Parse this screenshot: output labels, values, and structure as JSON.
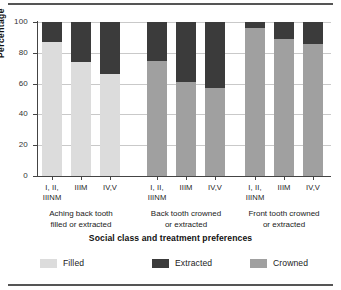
{
  "figure": {
    "rule_color": "#555555"
  },
  "chart_data": {
    "type": "bar",
    "stacked": true,
    "title": "",
    "xlabel": "Social class and treatment preferences",
    "ylabel": "Percentage",
    "ylim": [
      0,
      100
    ],
    "yticks": [
      0,
      20,
      40,
      60,
      80,
      100
    ],
    "ytick_labels": [
      "0",
      "20",
      "40",
      "60",
      "80",
      "100"
    ],
    "grid": true,
    "legend_position": "bottom",
    "categories": [
      "I, II, IIINM",
      "IIIM",
      "IV,V"
    ],
    "groups": [
      {
        "label_line1": "Aching back tooth",
        "label_line2": "filled or extracted",
        "bars": [
          {
            "category_line1": "I, II,",
            "category_line2": "IIINM",
            "Filled": 87,
            "Extracted": 13,
            "Crowned": 0
          },
          {
            "category_line1": "IIIM",
            "category_line2": "",
            "Filled": 74,
            "Extracted": 26,
            "Crowned": 0
          },
          {
            "category_line1": "IV,V",
            "category_line2": "",
            "Filled": 66,
            "Extracted": 34,
            "Crowned": 0
          }
        ]
      },
      {
        "label_line1": "Back tooth crowned",
        "label_line2": "or extracted",
        "bars": [
          {
            "category_line1": "I, II,",
            "category_line2": "IIINM",
            "Filled": 0,
            "Extracted": 25,
            "Crowned": 75
          },
          {
            "category_line1": "IIIM",
            "category_line2": "",
            "Filled": 0,
            "Extracted": 39,
            "Crowned": 61
          },
          {
            "category_line1": "IV,V",
            "category_line2": "",
            "Filled": 0,
            "Extracted": 43,
            "Crowned": 57
          }
        ]
      },
      {
        "label_line1": "Front tooth crowned",
        "label_line2": "or extracted",
        "bars": [
          {
            "category_line1": "I, II,",
            "category_line2": "IIINM",
            "Filled": 0,
            "Extracted": 4,
            "Crowned": 96
          },
          {
            "category_line1": "IIIM",
            "category_line2": "",
            "Filled": 0,
            "Extracted": 11,
            "Crowned": 89
          },
          {
            "category_line1": "IV,V",
            "category_line2": "",
            "Filled": 0,
            "Extracted": 14,
            "Crowned": 86
          }
        ]
      }
    ],
    "series": [
      {
        "name": "Filled",
        "color": "#dcdcdc"
      },
      {
        "name": "Extracted",
        "color": "#3b3b3b"
      },
      {
        "name": "Crowned",
        "color": "#a0a0a0"
      }
    ]
  }
}
